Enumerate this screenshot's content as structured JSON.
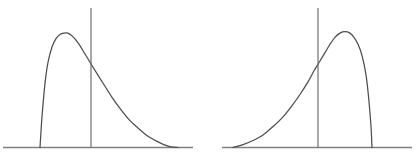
{
  "figure": {
    "background_color": "#ffffff",
    "curve_color": "#4d4d4d",
    "axis_color": "#808080",
    "cutline_color": "#6e6e6e",
    "panel_count": 2
  },
  "chart_data": [
    {
      "type": "line",
      "title": "",
      "subtitle": "",
      "xlabel": "",
      "ylabel": "",
      "grid": false,
      "legend": null,
      "panel": "left",
      "description": "right-skewed (positively skewed) probability density curve with a vertical cut line to the right of the mode",
      "xlim": [
        0,
        200
      ],
      "ylim": [
        0,
        100
      ],
      "axis": {
        "baseline_y": 0,
        "x_start": 3,
        "x_end": 193
      },
      "annotations": [
        {
          "name": "vertical-cut-line",
          "x": 91,
          "y_bottom": 0,
          "y_top": 100,
          "curve_intersection_y": 68
        }
      ],
      "features": {
        "mode_x": 68,
        "mode_y": 82,
        "skew": "right",
        "support_start_x": 40,
        "support_end_x": 178
      },
      "x": [
        40,
        42,
        45,
        48,
        52,
        56,
        60,
        64,
        68,
        72,
        76,
        80,
        85,
        91,
        97,
        104,
        112,
        120,
        129,
        138,
        148,
        158,
        168,
        178
      ],
      "y": [
        0,
        22,
        46,
        61,
        72,
        78,
        81,
        82,
        82,
        80,
        77,
        73,
        67,
        60,
        53,
        45,
        36,
        28,
        20,
        14,
        8,
        4,
        1,
        0
      ]
    },
    {
      "type": "line",
      "title": "",
      "subtitle": "",
      "xlabel": "",
      "ylabel": "",
      "grid": false,
      "legend": null,
      "panel": "right",
      "description": "left-skewed (negatively skewed) probability density curve with a vertical cut line to the left of the mode",
      "xlim": [
        0,
        200
      ],
      "ylim": [
        0,
        100
      ],
      "axis": {
        "baseline_y": 0,
        "x_start": 222,
        "x_end": 412
      },
      "annotations": [
        {
          "name": "vertical-cut-line",
          "x": 318,
          "y_bottom": 0,
          "y_top": 100,
          "curve_intersection_y": 69
        }
      ],
      "features": {
        "mode_x": 346,
        "mode_y": 83,
        "skew": "left",
        "support_start_x": 233,
        "support_end_x": 372
      },
      "x": [
        233,
        243,
        253,
        263,
        273,
        283,
        292,
        300,
        308,
        314,
        320,
        325,
        330,
        335,
        340,
        345,
        350,
        354,
        358,
        362,
        366,
        369,
        371,
        372
      ],
      "y": [
        0,
        2,
        5,
        9,
        15,
        22,
        30,
        38,
        47,
        55,
        62,
        68,
        74,
        79,
        82,
        83,
        82,
        79,
        74,
        66,
        52,
        33,
        15,
        0
      ]
    }
  ]
}
